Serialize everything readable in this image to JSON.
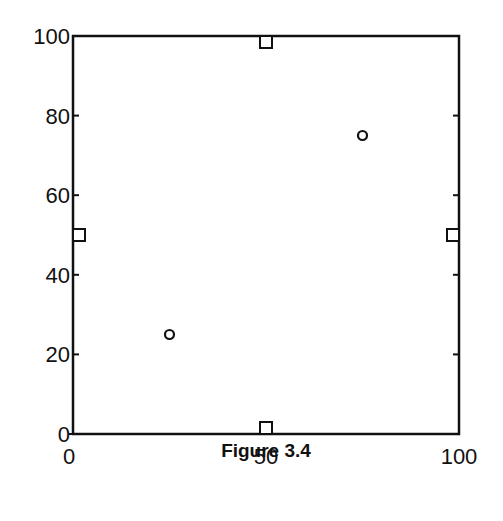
{
  "chart_data": {
    "type": "scatter",
    "title": "",
    "caption": "Figure 3.4",
    "xlabel": "",
    "ylabel": "",
    "xlim": [
      0,
      100
    ],
    "ylim": [
      0,
      100
    ],
    "grid": false,
    "legend": null,
    "x_ticks": [
      0,
      50,
      100
    ],
    "y_ticks": [
      0,
      20,
      40,
      60,
      80,
      100
    ],
    "x_tick_labels": [
      "0",
      "50",
      "100"
    ],
    "y_tick_labels": [
      "0",
      "20",
      "40",
      "60",
      "80",
      "100"
    ],
    "series": [
      {
        "name": "squares",
        "marker": "square",
        "points": [
          {
            "x": 50,
            "y": 100
          },
          {
            "x": 50,
            "y": 0
          },
          {
            "x": 0,
            "y": 50
          },
          {
            "x": 100,
            "y": 50
          }
        ]
      },
      {
        "name": "circles",
        "marker": "circle",
        "points": [
          {
            "x": 25,
            "y": 25
          },
          {
            "x": 75,
            "y": 75
          }
        ]
      }
    ]
  },
  "style": {
    "axis_color": "#111111",
    "marker_color": "#111111",
    "background": "#ffffff"
  }
}
